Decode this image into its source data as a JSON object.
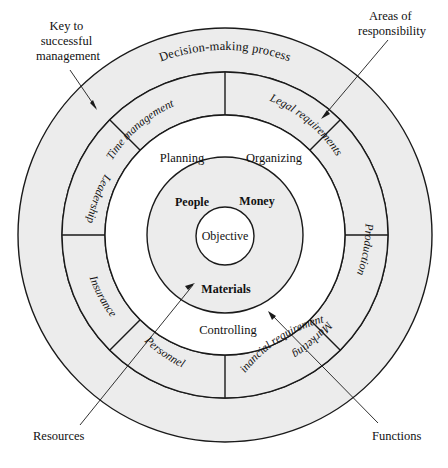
{
  "diagram": {
    "center": {
      "x": 225,
      "y": 235
    },
    "radii": {
      "outer": 207,
      "r2": 163,
      "r3": 120,
      "r4": 78,
      "core": 29
    },
    "colors": {
      "shade": "#ececec",
      "line": "#1a1a1a",
      "page": "#ffffff",
      "text": "#111111"
    },
    "rings": {
      "outer_label": "Decision-making process",
      "segments": [
        {
          "label": "Time management",
          "angle": -62
        },
        {
          "label": "Legal requirements",
          "angle": -28
        },
        {
          "label": "Production",
          "angle": 25
        },
        {
          "label": "Marketing",
          "angle": 62
        },
        {
          "label": "Financial requirements",
          "angle": 118
        },
        {
          "label": "Personnel",
          "angle": 152
        },
        {
          "label": "Insurance",
          "angle": 205
        },
        {
          "label": "Leadership",
          "angle": 243
        }
      ],
      "functions": [
        {
          "label": "Planning",
          "x": 182,
          "y": 157
        },
        {
          "label": "Organizing",
          "x": 273,
          "y": 157
        },
        {
          "label": "Controlling",
          "x": 228,
          "y": 330
        }
      ],
      "resources": [
        {
          "label": "People",
          "x": 192,
          "y": 201
        },
        {
          "label": "Money",
          "x": 256,
          "y": 200
        },
        {
          "label": "Materials",
          "x": 226,
          "y": 288
        }
      ],
      "core_label": "Objective"
    },
    "callouts": [
      {
        "name": "key-to-successful-management",
        "lines": [
          "Key to",
          "successful",
          "management"
        ],
        "x": 30,
        "y": 26,
        "align": "middle",
        "text_anchor_x": 68
      },
      {
        "name": "areas-of-responsibility",
        "lines": [
          "Areas of",
          "responsibility"
        ],
        "x": 352,
        "y": 14,
        "align": "middle",
        "text_anchor_x": 392
      },
      {
        "name": "resources-callout",
        "lines": [
          "Resources"
        ],
        "x": 33,
        "y": 436,
        "align": "start",
        "text_anchor_x": 33
      },
      {
        "name": "functions-callout",
        "lines": [
          "Functions"
        ],
        "x": 372,
        "y": 436,
        "align": "start",
        "text_anchor_x": 372
      }
    ]
  }
}
